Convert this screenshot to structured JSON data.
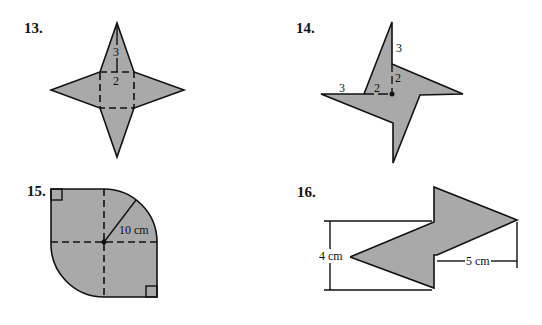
{
  "figures": [
    {
      "number": "13.",
      "description": "Four-pointed star formed by a square with four triangles",
      "labels": {
        "triangle_height": "3",
        "square_side": "2"
      }
    },
    {
      "number": "14.",
      "description": "Pinwheel shape made of four right triangles",
      "labels": {
        "top_leg": "3",
        "top_inner": "2",
        "left_leg": "3",
        "left_inner": "2"
      }
    },
    {
      "number": "15.",
      "description": "Square with two opposite quarter-circle corners",
      "labels": {
        "radius": "10 cm"
      }
    },
    {
      "number": "16.",
      "description": "Lightning-bolt arrow shape",
      "labels": {
        "height": "4 cm",
        "width": "5 cm"
      }
    }
  ],
  "colors": {
    "fill": "#a9a9a9",
    "stroke": "#111111",
    "background": "#ffffff"
  }
}
